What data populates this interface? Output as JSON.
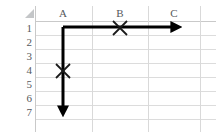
{
  "app": {
    "type": "spreadsheet-grid-illustration",
    "background_color": "#ffffff",
    "gridline_color": "#d9d9d9",
    "header_text_color": "#55595c",
    "arrow_color": "#000000",
    "marker_color": "#1a1a1a"
  },
  "corner": {
    "select_all_name": "select-all-triangle",
    "color": "#c4c6c8"
  },
  "columns": {
    "headers": [
      {
        "label": "A",
        "center_x": 63
      },
      {
        "label": "B",
        "center_x": 120
      },
      {
        "label": "C",
        "center_x": 174
      }
    ],
    "boundaries_x": [
      35,
      92,
      148,
      200,
      216
    ]
  },
  "rows": {
    "headers": [
      {
        "label": "1",
        "center_y": 28
      },
      {
        "label": "2",
        "center_y": 42
      },
      {
        "label": "3",
        "center_y": 56
      },
      {
        "label": "4",
        "center_y": 70
      },
      {
        "label": "5",
        "center_y": 84
      },
      {
        "label": "6",
        "center_y": 98
      },
      {
        "label": "7",
        "center_y": 112
      }
    ],
    "boundaries_y": [
      21,
      35,
      49,
      63,
      77,
      91,
      105,
      119
    ]
  },
  "annotations": {
    "origin": {
      "x": 63,
      "y": 27
    },
    "arrows": [
      {
        "name": "horizontal-arrow-right",
        "direction": "right",
        "from": {
          "x": 63,
          "y": 27
        },
        "to": {
          "x": 185,
          "y": 27
        },
        "stroke_width": 3,
        "color": "#000000"
      },
      {
        "name": "vertical-arrow-down",
        "direction": "down",
        "from": {
          "x": 63,
          "y": 27
        },
        "to": {
          "x": 63,
          "y": 120
        },
        "stroke_width": 3,
        "color": "#000000"
      }
    ],
    "markers": [
      {
        "name": "x-marker-column-b",
        "glyph": "×",
        "cell": "B1",
        "x": 120,
        "y": 28,
        "size": 17,
        "color": "#1a1a1a"
      },
      {
        "name": "x-marker-row-4",
        "glyph": "×",
        "cell": "A4",
        "x": 63,
        "y": 71,
        "size": 17,
        "color": "#1a1a1a"
      }
    ]
  }
}
